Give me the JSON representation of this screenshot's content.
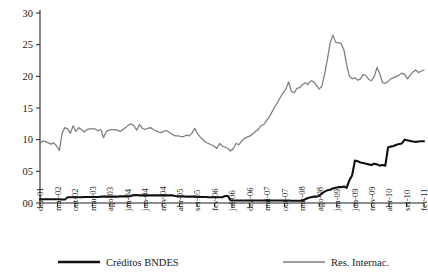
{
  "chart_data": {
    "type": "line",
    "title": "",
    "subtitle": "",
    "xlabel": "",
    "ylabel": "",
    "grid": false,
    "legend_position": "bottom",
    "ylim": [
      0,
      30
    ],
    "ytick_labels": [
      "00",
      "05",
      "10",
      "15",
      "20",
      "25",
      "30"
    ],
    "ytick_values": [
      0,
      5,
      10,
      15,
      20,
      25,
      30
    ],
    "xtick_labels": [
      "dez-01",
      "mai-02",
      "out-02",
      "mar-03",
      "ago-03",
      "jan-04",
      "jun-04",
      "nov-04",
      "abr-05",
      "set-05",
      "fev-06",
      "jul-06",
      "dez-06",
      "mai-07",
      "out-07",
      "mar-08",
      "ago-08",
      "jan-09",
      "jun-09",
      "nov-09",
      "abr-10",
      "set-10",
      "fev-11"
    ],
    "x_start": "dez-01",
    "x_end": "fev-11",
    "x_frequency": "monthly",
    "series": [
      {
        "name": "Créditos BNDES",
        "color": "#111111",
        "width": 2.1,
        "values": [
          0.6,
          0.6,
          0.6,
          0.6,
          0.6,
          0.6,
          0.6,
          0.6,
          0.55,
          0.55,
          0.9,
          0.9,
          0.9,
          0.9,
          0.9,
          0.9,
          0.95,
          0.95,
          0.95,
          0.95,
          0.95,
          0.95,
          1.0,
          1.0,
          1.0,
          1.0,
          1.0,
          1.0,
          1.0,
          1.05,
          1.05,
          1.05,
          1.05,
          1.1,
          1.25,
          1.25,
          1.2,
          1.2,
          1.2,
          1.2,
          1.2,
          1.2,
          1.2,
          1.2,
          1.2,
          1.2,
          1.2,
          1.2,
          1.2,
          1.1,
          1.05,
          1.05,
          1.05,
          1.0,
          1.0,
          1.0,
          1.0,
          0.95,
          0.95,
          0.95,
          0.95,
          0.9,
          0.9,
          0.9,
          0.9,
          0.9,
          0.9,
          1.1,
          1.1,
          0.4,
          0.4,
          0.4,
          0.4,
          0.4,
          0.4,
          0.4,
          0.4,
          0.4,
          0.4,
          0.4,
          0.4,
          0.4,
          0.4,
          0.4,
          0.4,
          0.4,
          0.4,
          0.4,
          0.4,
          0.4,
          0.4,
          0.35,
          0.35,
          0.35,
          0.35,
          0.4,
          0.6,
          0.8,
          0.9,
          1.0,
          1.0,
          1.1,
          1.5,
          1.8,
          2.0,
          2.1,
          2.3,
          2.4,
          2.5,
          2.5,
          2.6,
          2.4,
          3.6,
          4.4,
          6.7,
          6.6,
          6.4,
          6.3,
          6.2,
          6.1,
          6.0,
          6.2,
          6.1,
          5.9,
          6.0,
          5.9,
          8.8,
          8.9,
          9.0,
          9.2,
          9.3,
          9.4,
          10.0,
          9.9,
          9.8,
          9.7,
          9.65,
          9.7,
          9.75,
          9.75
        ]
      },
      {
        "name": "Res. Internac.",
        "color": "#7d7d7d",
        "width": 1.25,
        "values": [
          9.4,
          9.8,
          9.7,
          9.5,
          9.3,
          9.5,
          9.0,
          8.3,
          11.0,
          11.9,
          11.7,
          11.0,
          12.2,
          11.3,
          11.9,
          11.6,
          11.2,
          11.6,
          11.7,
          11.7,
          11.7,
          11.4,
          11.6,
          10.3,
          11.3,
          11.5,
          11.6,
          11.6,
          11.5,
          11.3,
          11.6,
          11.9,
          12.3,
          12.5,
          12.2,
          11.5,
          12.4,
          11.8,
          11.6,
          11.8,
          11.9,
          11.6,
          11.4,
          11.2,
          11.1,
          11.4,
          11.4,
          11.1,
          10.8,
          10.6,
          10.6,
          10.5,
          10.5,
          10.7,
          10.6,
          11.0,
          11.8,
          11.0,
          10.4,
          10.0,
          9.6,
          9.4,
          9.2,
          9.0,
          8.6,
          9.4,
          9.0,
          8.8,
          8.6,
          8.2,
          8.6,
          9.4,
          9.2,
          9.8,
          10.2,
          10.4,
          10.6,
          10.9,
          11.3,
          11.6,
          12.2,
          12.4,
          13.0,
          13.6,
          14.4,
          15.2,
          15.9,
          16.7,
          17.4,
          18.0,
          19.1,
          17.6,
          17.4,
          18.1,
          18.2,
          18.7,
          19.0,
          18.7,
          19.3,
          19.2,
          18.6,
          18.0,
          18.4,
          20.3,
          22.6,
          25.2,
          26.5,
          25.4,
          25.3,
          25.2,
          24.2,
          21.8,
          20.0,
          19.6,
          19.8,
          19.4,
          19.6,
          20.3,
          20.1,
          19.5,
          19.3,
          20.0,
          21.4,
          20.4,
          19.0,
          18.9,
          19.2,
          19.6,
          19.8,
          20.0,
          20.2,
          20.5,
          20.3,
          19.6,
          20.2,
          20.7,
          21.0,
          20.6,
          20.8,
          21.0
        ]
      }
    ],
    "legend": [
      {
        "label": "Créditos BNDES",
        "color": "#111111",
        "style": "thick-solid"
      },
      {
        "label": "Res. Internac.",
        "color": "#7d7d7d",
        "style": "thin-solid"
      }
    ]
  }
}
